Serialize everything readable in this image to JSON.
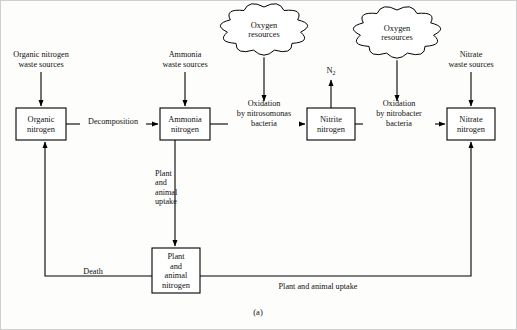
{
  "figure": {
    "caption": "(a)",
    "background": "#fdfdfc",
    "line_color": "#000000"
  },
  "boxes": [
    {
      "id": "organic",
      "lines": [
        "Organic",
        "nitrogen"
      ],
      "x": 16,
      "y": 108,
      "w": 50,
      "h": 32
    },
    {
      "id": "ammonia",
      "lines": [
        "Ammonia",
        "nitrogen"
      ],
      "x": 160,
      "y": 108,
      "w": 50,
      "h": 32
    },
    {
      "id": "nitrite",
      "lines": [
        "Nitrite",
        "nitrogen"
      ],
      "x": 307,
      "y": 108,
      "w": 48,
      "h": 32
    },
    {
      "id": "nitrate",
      "lines": [
        "Nitrate",
        "nitrogen"
      ],
      "x": 447,
      "y": 108,
      "w": 48,
      "h": 32
    },
    {
      "id": "plant",
      "lines": [
        "Plant",
        "and",
        "animal",
        "nitrogen"
      ],
      "x": 152,
      "y": 248,
      "w": 48,
      "h": 45
    }
  ],
  "clouds": [
    {
      "id": "oxygen-1",
      "lines": [
        "Oxygen",
        "resources"
      ],
      "cx": 264,
      "cy": 29,
      "rx": 37,
      "ry": 22
    },
    {
      "id": "oxygen-2",
      "lines": [
        "Oxygen",
        "resources"
      ],
      "cx": 397,
      "cy": 32,
      "rx": 37,
      "ry": 22
    }
  ],
  "source_labels": [
    {
      "id": "organic-waste",
      "lines": [
        "Organic nitrogen",
        "waste sources"
      ],
      "cx": 41,
      "cy": 62
    },
    {
      "id": "ammonia-waste",
      "lines": [
        "Ammonia",
        "waste sources"
      ],
      "cx": 185,
      "cy": 62
    },
    {
      "id": "nitrate-waste",
      "lines": [
        "Nitrate",
        "waste sources"
      ],
      "cx": 471,
      "cy": 62
    }
  ],
  "flow_labels": [
    {
      "id": "decomposition",
      "lines": [
        "Decomposition"
      ],
      "cx": 113,
      "cy": 124
    },
    {
      "id": "nitrosomonas",
      "lines": [
        "Oxidation",
        "by nitrosomonas",
        "bacteria"
      ],
      "cx": 264,
      "cy": 116
    },
    {
      "id": "nitrobacter",
      "lines": [
        "Oxidation",
        "by nitrobacter",
        "bacteria"
      ],
      "cx": 399,
      "cy": 116
    },
    {
      "id": "uptake-vert",
      "lines": [
        "Plant",
        "and",
        "animal",
        "uptake"
      ],
      "cx": 155,
      "cy": 190,
      "align": "start"
    },
    {
      "id": "death",
      "lines": [
        "Death"
      ],
      "cx": 93,
      "cy": 274
    },
    {
      "id": "uptake-horiz",
      "lines": [
        "Plant and animal uptake"
      ],
      "cx": 318,
      "cy": 289
    }
  ],
  "outputs": [
    {
      "id": "n2",
      "text": "N",
      "sub": "2",
      "cx": 331,
      "cy": 73
    }
  ],
  "connections": [
    {
      "id": "organic-waste-to-organic",
      "from": "organic-waste-source",
      "to": "organic",
      "type": "arrow-down"
    },
    {
      "id": "ammonia-waste-to-ammonia",
      "from": "ammonia-waste-source",
      "to": "ammonia",
      "type": "arrow-down"
    },
    {
      "id": "nitrate-waste-to-nitrate",
      "from": "nitrate-waste-source",
      "to": "nitrate",
      "type": "arrow-down"
    },
    {
      "id": "organic-to-ammonia",
      "from": "organic",
      "to": "ammonia",
      "type": "arrow-right",
      "label": "decomposition"
    },
    {
      "id": "ammonia-to-nitrite",
      "from": "ammonia",
      "to": "nitrite",
      "type": "arrow-right",
      "label": "nitrosomonas"
    },
    {
      "id": "nitrite-to-nitrate",
      "from": "nitrite",
      "to": "nitrate",
      "type": "arrow-right",
      "label": "nitrobacter"
    },
    {
      "id": "oxygen1-to-nitrosomonas",
      "from": "oxygen-1",
      "to": "nitrosomonas",
      "type": "arrow-down"
    },
    {
      "id": "oxygen2-to-nitrobacter",
      "from": "oxygen-2",
      "to": "nitrobacter",
      "type": "arrow-down"
    },
    {
      "id": "nitrite-to-n2",
      "from": "nitrite",
      "to": "n2",
      "type": "arrow-up"
    },
    {
      "id": "ammonia-to-plant",
      "from": "ammonia",
      "to": "plant",
      "type": "arrow-down",
      "label": "uptake-vert"
    },
    {
      "id": "plant-to-organic",
      "from": "plant",
      "to": "organic",
      "type": "elbow-arrow-up-left",
      "label": "death"
    },
    {
      "id": "nitrate-to-plant",
      "from": "nitrate",
      "to": "plant",
      "type": "elbow-arrow-up-right",
      "label": "uptake-horiz"
    }
  ]
}
